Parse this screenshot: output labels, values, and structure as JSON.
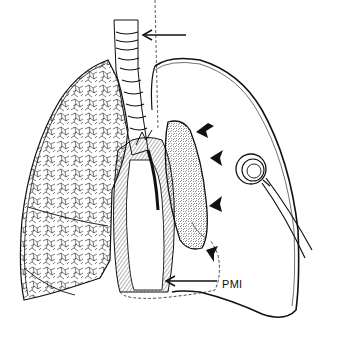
{
  "figure": {
    "type": "anatomical-illustration",
    "labels": {
      "pmi": "PMI"
    },
    "arrows": {
      "tracheal_arrow": "points left toward trachea at dashed midline",
      "pmi_arrow": "points left from PMI label toward heart apex",
      "bold_arrowheads_count": 4
    },
    "colors": {
      "ink": "#111111",
      "background": "#ffffff"
    }
  }
}
